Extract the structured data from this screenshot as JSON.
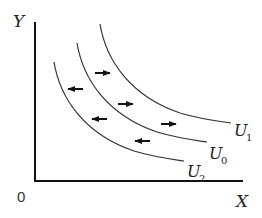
{
  "diagram": {
    "type": "indifference-curves",
    "axes": {
      "y_label": "Y",
      "x_label": "X",
      "origin_label": "0"
    },
    "curves": [
      {
        "name": "U",
        "subscript": "1",
        "label": "U1",
        "order": "outermost"
      },
      {
        "name": "U",
        "subscript": "0",
        "label": "U0",
        "order": "middle"
      },
      {
        "name": "U",
        "subscript": "2",
        "label": "U2",
        "order": "innermost"
      }
    ],
    "arrows": [
      {
        "direction": "right",
        "between": "U0-U1"
      },
      {
        "direction": "right",
        "between": "U0-U1"
      },
      {
        "direction": "right",
        "between": "U0-U1"
      },
      {
        "direction": "left",
        "between": "U2-U0"
      },
      {
        "direction": "left",
        "between": "U2-U0"
      },
      {
        "direction": "left",
        "between": "U2-U0"
      }
    ],
    "colors": {
      "background": "#ffffff",
      "lines": "#222222"
    }
  }
}
